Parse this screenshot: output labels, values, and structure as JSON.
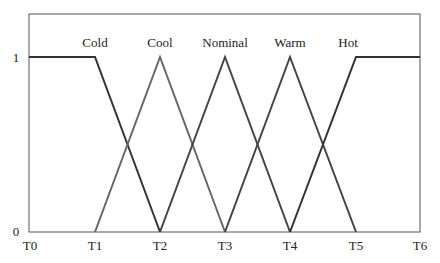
{
  "diagram": {
    "type": "fuzzy-membership-functions",
    "y_axis": {
      "ticks": [
        {
          "label": "1",
          "value": 1
        },
        {
          "label": "0",
          "value": 0
        }
      ]
    },
    "x_axis": {
      "ticks": [
        "T0",
        "T1",
        "T2",
        "T3",
        "T4",
        "T5",
        "T6"
      ]
    },
    "sets": [
      {
        "name": "Cold",
        "shape": "trapezoid-left",
        "points": [
          "T0:1",
          "T1:1",
          "T2:0"
        ]
      },
      {
        "name": "Cool",
        "shape": "triangle",
        "points": [
          "T1:0",
          "T2:1",
          "T3:0"
        ]
      },
      {
        "name": "Nominal",
        "shape": "triangle",
        "points": [
          "T2:0",
          "T3:1",
          "T4:0"
        ]
      },
      {
        "name": "Warm",
        "shape": "triangle",
        "points": [
          "T3:0",
          "T4:1",
          "T5:0"
        ]
      },
      {
        "name": "Hot",
        "shape": "trapezoid-right",
        "points": [
          "T4:0",
          "T5:1",
          "T6:1"
        ]
      }
    ],
    "colors": {
      "dark_line": "#333333",
      "light_line": "#666666",
      "frame": "#555555"
    }
  }
}
